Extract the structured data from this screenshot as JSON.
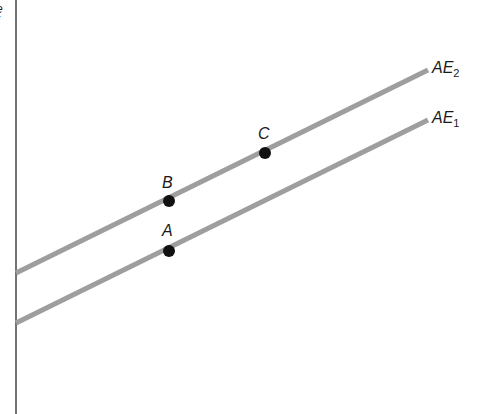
{
  "diagram": {
    "type": "aggregate-expenditure",
    "axis_cut_text": [
      "e",
      "f"
    ],
    "lines": [
      {
        "id": "AE2",
        "label_main": "AE",
        "label_sub": "2",
        "x1": 16,
        "y1": 273,
        "x2": 428,
        "y2": 70,
        "color": "#9e9e9e"
      },
      {
        "id": "AE1",
        "label_main": "AE",
        "label_sub": "1",
        "x1": 16,
        "y1": 323,
        "x2": 428,
        "y2": 120,
        "color": "#9e9e9e"
      }
    ],
    "points": [
      {
        "id": "A",
        "label": "A",
        "x": 169,
        "y": 251
      },
      {
        "id": "B",
        "label": "B",
        "x": 169,
        "y": 201
      },
      {
        "id": "C",
        "label": "C",
        "x": 265,
        "y": 153
      }
    ],
    "colors": {
      "axis": "#444444",
      "line": "#9e9e9e",
      "point": "#111111"
    }
  }
}
